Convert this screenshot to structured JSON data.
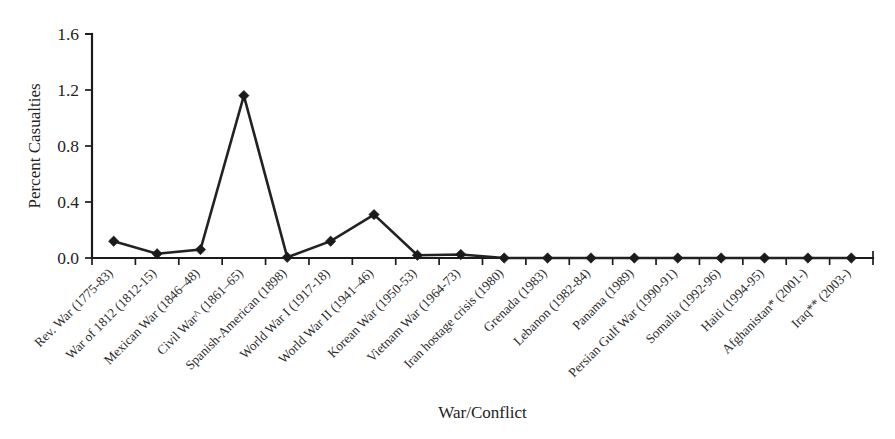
{
  "chart_data": {
    "type": "line",
    "title": "",
    "subtitle": "",
    "xlabel": "War/Conflict",
    "ylabel": "Percent Casualties",
    "ylim": [
      0.0,
      1.6
    ],
    "yticks": [
      "0.0",
      "0.4",
      "0.8",
      "1.2",
      "1.6"
    ],
    "ytick_values": [
      0.0,
      0.4,
      0.8,
      1.2,
      1.6
    ],
    "grid": false,
    "legend": false,
    "legend_position": "none",
    "marker": "filled-diamond",
    "line_color": "#222222",
    "marker_color": "#1b1b1b",
    "categories": [
      "Rev. War (1775-83)",
      "War of 1812 (1812-15)",
      "Mexican War (1846–48)",
      "Civil War^ (1861–65)",
      "Spanish-American (1898)",
      "World War I (1917-18)",
      "World War II (1941–46)",
      "Korean War (1950-53)",
      "Vietnam War (1964-73)",
      "Iran hostage crisis (1980)",
      "Grenada (1983)",
      "Lebanon (1982-84)",
      "Panama (1989)",
      "Persian Gulf War (1990-91)",
      "Somalia (1992-96)",
      "Haiti (1994-95)",
      "Afghanistan* (2001-)",
      "Iraq** (2003-)"
    ],
    "values": [
      0.12,
      0.03,
      0.06,
      1.16,
      0.005,
      0.12,
      0.31,
      0.02,
      0.025,
      0.0,
      0.0,
      0.0,
      0.0,
      0.0,
      0.0,
      0.0,
      0.0,
      0.0
    ]
  }
}
